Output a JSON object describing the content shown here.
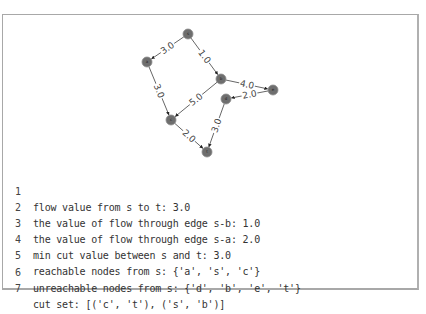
{
  "graph": {
    "nodes": [
      {
        "id": "s",
        "x": 188,
        "y": 34
      },
      {
        "id": "a",
        "x": 147,
        "y": 62
      },
      {
        "id": "b",
        "x": 221,
        "y": 79
      },
      {
        "id": "c",
        "x": 171,
        "y": 120
      },
      {
        "id": "d",
        "x": 226,
        "y": 99
      },
      {
        "id": "e",
        "x": 273,
        "y": 90
      },
      {
        "id": "t",
        "x": 207,
        "y": 152
      }
    ],
    "edges": [
      {
        "from": "s",
        "to": "a",
        "label": "3.0"
      },
      {
        "from": "s",
        "to": "b",
        "label": "1.0"
      },
      {
        "from": "a",
        "to": "c",
        "label": "3.0"
      },
      {
        "from": "b",
        "to": "c",
        "label": "5.0"
      },
      {
        "from": "b",
        "to": "e",
        "label": "4.0"
      },
      {
        "from": "e",
        "to": "d",
        "label": "2.0"
      },
      {
        "from": "c",
        "to": "t",
        "label": "2.0"
      },
      {
        "from": "d",
        "to": "t",
        "label": "3.0"
      }
    ],
    "node_color": "#6e6e6e",
    "edge_color": "#555555"
  },
  "output_lines": [
    {
      "num": "1",
      "text": "flow value from s to t: 3.0"
    },
    {
      "num": "2",
      "text": "the value of flow through edge s-b: 1.0"
    },
    {
      "num": "3",
      "text": "the value of flow through edge s-a: 2.0"
    },
    {
      "num": "4",
      "text": "min cut value between s and t: 3.0"
    },
    {
      "num": "5",
      "text": "reachable nodes from s: {'a', 's', 'c'}"
    },
    {
      "num": "6",
      "text": "unreachable nodes from s: {'d', 'b', 'e', 't'}"
    },
    {
      "num": "7",
      "text": "cut set: [('c', 't'), ('s', 'b')]"
    }
  ]
}
